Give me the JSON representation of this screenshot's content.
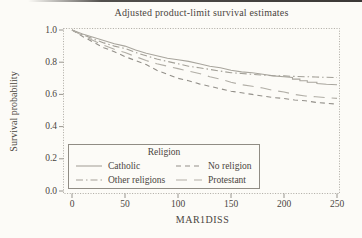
{
  "title": "Adjusted product-limit survival estimates",
  "axes": {
    "x_label": "MAR1DISS",
    "y_label": "Survival probability",
    "x_ticks": [
      0,
      50,
      100,
      150,
      200,
      250
    ],
    "y_ticks": [
      "1.0",
      "0.8",
      "0.6",
      "0.4",
      "0.2",
      "0.0"
    ],
    "x_range": [
      0,
      250
    ],
    "y_range": [
      0.0,
      1.0
    ]
  },
  "legend": {
    "title": "Religion",
    "entries": [
      {
        "label": "Catholic",
        "style": "solid",
        "color": "#a8a59d"
      },
      {
        "label": "No religion",
        "style": "dashed",
        "color": "#93908a"
      },
      {
        "label": "Other religions",
        "style": "dash-dot",
        "color": "#a3a098"
      },
      {
        "label": "Protestant",
        "style": "long-dash",
        "color": "#b1aea6"
      }
    ]
  },
  "colors": {
    "paper": "#fcfbf7",
    "text": "#4a453e",
    "frame": "#a39f97",
    "tick": "#8d8981"
  },
  "chart_data": {
    "type": "line",
    "title": "Adjusted product-limit survival estimates",
    "xlabel": "MAR1DISS",
    "ylabel": "Survival probability",
    "xlim": [
      0,
      250
    ],
    "ylim": [
      0.0,
      1.0
    ],
    "grid": false,
    "legend_position": "inside bottom-left, titled box",
    "series": [
      {
        "name": "Catholic",
        "line_style": "solid",
        "color": "#a8a59d",
        "points": [
          [
            0,
            1.0
          ],
          [
            10,
            0.975
          ],
          [
            20,
            0.955
          ],
          [
            30,
            0.935
          ],
          [
            40,
            0.915
          ],
          [
            50,
            0.9
          ],
          [
            60,
            0.875
          ],
          [
            70,
            0.855
          ],
          [
            80,
            0.84
          ],
          [
            90,
            0.825
          ],
          [
            100,
            0.815
          ],
          [
            110,
            0.805
          ],
          [
            120,
            0.79
          ],
          [
            130,
            0.775
          ],
          [
            140,
            0.765
          ],
          [
            150,
            0.75
          ],
          [
            160,
            0.74
          ],
          [
            170,
            0.735
          ],
          [
            180,
            0.725
          ],
          [
            190,
            0.715
          ],
          [
            200,
            0.71
          ],
          [
            208,
            0.705
          ],
          [
            208,
            0.695
          ],
          [
            215,
            0.695
          ],
          [
            215,
            0.685
          ],
          [
            222,
            0.685
          ],
          [
            222,
            0.675
          ],
          [
            231,
            0.675
          ],
          [
            231,
            0.667
          ],
          [
            240,
            0.663
          ],
          [
            250,
            0.66
          ]
        ]
      },
      {
        "name": "Other religions",
        "line_style": "dash-dot",
        "color": "#a3a098",
        "points": [
          [
            0,
            1.0
          ],
          [
            10,
            0.97
          ],
          [
            20,
            0.945
          ],
          [
            30,
            0.92
          ],
          [
            40,
            0.9
          ],
          [
            50,
            0.885
          ],
          [
            60,
            0.86
          ],
          [
            70,
            0.84
          ],
          [
            80,
            0.82
          ],
          [
            90,
            0.805
          ],
          [
            100,
            0.79
          ],
          [
            110,
            0.775
          ],
          [
            120,
            0.765
          ],
          [
            130,
            0.755
          ],
          [
            140,
            0.745
          ],
          [
            150,
            0.735
          ],
          [
            160,
            0.73
          ],
          [
            170,
            0.725
          ],
          [
            180,
            0.72
          ],
          [
            190,
            0.716
          ],
          [
            200,
            0.715
          ],
          [
            210,
            0.712
          ],
          [
            220,
            0.71
          ],
          [
            230,
            0.708
          ],
          [
            240,
            0.706
          ],
          [
            250,
            0.705
          ]
        ]
      },
      {
        "name": "No religion",
        "line_style": "dashed",
        "color": "#93908a",
        "points": [
          [
            0,
            1.0
          ],
          [
            10,
            0.96
          ],
          [
            20,
            0.925
          ],
          [
            30,
            0.89
          ],
          [
            40,
            0.865
          ],
          [
            50,
            0.835
          ],
          [
            60,
            0.81
          ],
          [
            70,
            0.785
          ],
          [
            80,
            0.75
          ],
          [
            90,
            0.725
          ],
          [
            100,
            0.7
          ],
          [
            110,
            0.685
          ],
          [
            120,
            0.665
          ],
          [
            130,
            0.65
          ],
          [
            140,
            0.635
          ],
          [
            150,
            0.62
          ],
          [
            160,
            0.61
          ],
          [
            170,
            0.6
          ],
          [
            180,
            0.59
          ],
          [
            190,
            0.58
          ],
          [
            200,
            0.575
          ],
          [
            210,
            0.565
          ],
          [
            220,
            0.56
          ],
          [
            230,
            0.55
          ],
          [
            240,
            0.545
          ],
          [
            250,
            0.54
          ]
        ]
      },
      {
        "name": "Protestant",
        "line_style": "long-dash",
        "color": "#b1aea6",
        "points": [
          [
            0,
            1.0
          ],
          [
            10,
            0.965
          ],
          [
            20,
            0.935
          ],
          [
            30,
            0.905
          ],
          [
            40,
            0.88
          ],
          [
            50,
            0.86
          ],
          [
            60,
            0.835
          ],
          [
            70,
            0.81
          ],
          [
            80,
            0.79
          ],
          [
            90,
            0.775
          ],
          [
            100,
            0.76
          ],
          [
            110,
            0.745
          ],
          [
            120,
            0.73
          ],
          [
            130,
            0.71
          ],
          [
            140,
            0.695
          ],
          [
            150,
            0.675
          ],
          [
            160,
            0.66
          ],
          [
            170,
            0.65
          ],
          [
            180,
            0.64
          ],
          [
            190,
            0.625
          ],
          [
            200,
            0.615
          ],
          [
            210,
            0.6
          ],
          [
            220,
            0.59
          ],
          [
            230,
            0.585
          ],
          [
            240,
            0.58
          ],
          [
            250,
            0.575
          ]
        ]
      }
    ]
  }
}
